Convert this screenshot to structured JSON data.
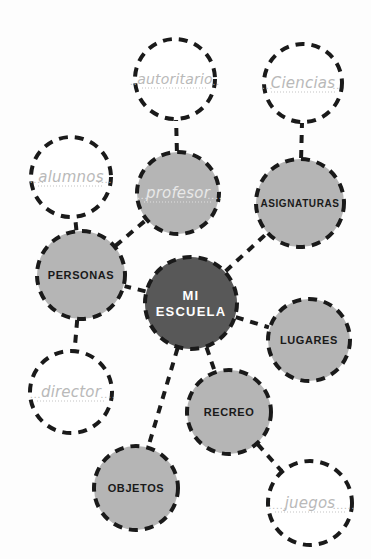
{
  "diagram": {
    "type": "mind-map",
    "background_color": "#fdfdfd",
    "colors": {
      "center_fill": "#585858",
      "center_text": "#ffffff",
      "branch_fill": "#b5b5b5",
      "branch_text": "#1a1a1a",
      "empty_fill": "#ffffff",
      "empty_text": "#b9b9b9",
      "hand_text_on_gray": "#e8e8e8",
      "stroke": "#1a1a1a"
    },
    "nodes": [
      {
        "id": "center",
        "label": "MI ESCUELA",
        "line1": "MI",
        "line2": "ESCUELA",
        "kind": "center",
        "cx": 191,
        "cy": 303,
        "r": 46,
        "font_size": 13
      },
      {
        "id": "personas",
        "label": "PERSONAS",
        "kind": "branch",
        "cx": 81,
        "cy": 275,
        "r": 44,
        "font_size": 11
      },
      {
        "id": "asignaturas",
        "label": "ASIGNATURAS",
        "kind": "branch",
        "cx": 300,
        "cy": 203,
        "r": 44,
        "font_size": 10
      },
      {
        "id": "lugares",
        "label": "LUGARES",
        "kind": "branch",
        "cx": 309,
        "cy": 340,
        "r": 41,
        "font_size": 11
      },
      {
        "id": "recreo",
        "label": "RECREO",
        "kind": "branch",
        "cx": 229,
        "cy": 412,
        "r": 42,
        "font_size": 11
      },
      {
        "id": "objetos",
        "label": "OBJETOS",
        "kind": "branch",
        "cx": 136,
        "cy": 488,
        "r": 42,
        "font_size": 11
      },
      {
        "id": "profesor",
        "label": "profesor",
        "kind": "filled-handwritten",
        "cx": 178,
        "cy": 193,
        "r": 41,
        "font_size": 15
      },
      {
        "id": "autoritario",
        "label": "autoritario",
        "kind": "empty-handwritten",
        "cx": 175,
        "cy": 79,
        "r": 40,
        "font_size": 14
      },
      {
        "id": "ciencias",
        "label": "Ciencias",
        "kind": "empty-handwritten",
        "cx": 303,
        "cy": 83,
        "r": 39,
        "font_size": 15
      },
      {
        "id": "alumnos",
        "label": "alumnos",
        "kind": "empty-handwritten",
        "cx": 71,
        "cy": 177,
        "r": 40,
        "font_size": 15
      },
      {
        "id": "director",
        "label": "director",
        "kind": "empty-handwritten",
        "cx": 71,
        "cy": 392,
        "r": 41,
        "font_size": 15
      },
      {
        "id": "juegos",
        "label": "juegos",
        "kind": "empty-handwritten",
        "cx": 310,
        "cy": 503,
        "r": 42,
        "font_size": 15
      }
    ],
    "leaders": {
      "autoritario": {
        "left": "..",
        "right": ".."
      },
      "ciencias": {
        "left": "...",
        "right": ".."
      },
      "alumnos": {
        "left": "....",
        "right": "...."
      },
      "profesor": {
        "left": "...",
        "right": "...."
      },
      "director": {
        "left": "...",
        "right": "...."
      },
      "juegos": {
        "left": ".....",
        "right": "......"
      }
    },
    "connections": [
      {
        "from": "center",
        "to": "personas"
      },
      {
        "from": "center",
        "to": "asignaturas"
      },
      {
        "from": "center",
        "to": "lugares"
      },
      {
        "from": "center",
        "to": "recreo"
      },
      {
        "from": "center",
        "to": "objetos"
      },
      {
        "from": "personas",
        "to": "profesor"
      },
      {
        "from": "personas",
        "to": "alumnos"
      },
      {
        "from": "personas",
        "to": "director"
      },
      {
        "from": "profesor",
        "to": "autoritario"
      },
      {
        "from": "asignaturas",
        "to": "ciencias"
      },
      {
        "from": "recreo",
        "to": "juegos"
      }
    ]
  }
}
